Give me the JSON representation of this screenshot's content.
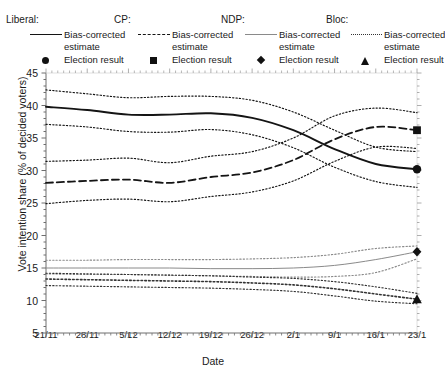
{
  "legend": {
    "groups": [
      {
        "title": "Liberal:",
        "line_label": "Bias-corrected\nestimate",
        "marker_label": "Election result",
        "line_style": "solid",
        "marker": "circle",
        "color": "#141414"
      },
      {
        "title": "CP:",
        "line_label": "Bias-corrected\nestimate",
        "marker_label": "Election result",
        "line_style": "dashed",
        "marker": "square",
        "color": "#141414"
      },
      {
        "title": "NDP:",
        "line_label": "Bias-corrected\nestimate",
        "marker_label": "Election result",
        "line_style": "thin-solid",
        "marker": "diamond",
        "color": "#8a8a8a"
      },
      {
        "title": "Bloc:",
        "line_label": "Bias-corrected\nestimate",
        "marker_label": "Election result",
        "line_style": "dotted",
        "marker": "triangle",
        "color": "#333333"
      }
    ]
  },
  "chart_data": {
    "type": "line",
    "title": "",
    "xlabel": "Date",
    "ylabel": "Vote intention share (% of decided voters)",
    "ylim": [
      5,
      45
    ],
    "yticks": [
      5,
      10,
      15,
      20,
      25,
      30,
      35,
      40,
      45
    ],
    "y_minor_step": 1,
    "grid": false,
    "legend_position": "top",
    "x": [
      "21/11",
      "28/11",
      "5/12",
      "12/12",
      "19/12",
      "26/12",
      "2/1",
      "9/1",
      "16/1",
      "23/1"
    ],
    "x_minor_per_major": 7,
    "series": [
      {
        "name": "Liberal",
        "style": "solid",
        "color": "#141414",
        "values": [
          39.8,
          39.3,
          38.6,
          38.6,
          38.8,
          38.1,
          36.2,
          33.3,
          31.0,
          30.2
        ],
        "band_upper": [
          42.4,
          41.8,
          41.2,
          41.4,
          41.4,
          40.8,
          39.0,
          36.2,
          33.6,
          32.9
        ],
        "band_lower": [
          37.1,
          36.7,
          36.0,
          35.9,
          36.3,
          35.5,
          33.5,
          30.5,
          28.3,
          27.4
        ],
        "election_result": 30.2,
        "election_marker": "circle"
      },
      {
        "name": "CP",
        "style": "dashed",
        "color": "#141414",
        "values": [
          28.1,
          28.4,
          28.6,
          28.1,
          29.0,
          29.7,
          31.6,
          34.8,
          36.7,
          36.2
        ],
        "band_upper": [
          31.4,
          31.6,
          31.9,
          31.2,
          32.2,
          32.9,
          35.0,
          38.4,
          39.6,
          38.9
        ],
        "band_lower": [
          24.9,
          25.4,
          25.6,
          25.2,
          26.0,
          26.7,
          28.4,
          31.4,
          33.6,
          33.4
        ],
        "election_result": 36.2,
        "election_marker": "square"
      },
      {
        "name": "NDP",
        "style": "thin-solid",
        "color": "#8a8a8a",
        "values": [
          15.0,
          15.0,
          15.0,
          15.0,
          14.9,
          14.9,
          15.0,
          15.4,
          16.3,
          17.5
        ],
        "band_upper": [
          16.2,
          16.2,
          16.3,
          16.3,
          16.3,
          16.4,
          16.6,
          17.1,
          18.0,
          18.4
        ],
        "band_lower": [
          14.1,
          14.0,
          14.0,
          13.9,
          13.8,
          13.7,
          13.6,
          13.7,
          14.3,
          16.4
        ],
        "election_result": 17.5,
        "election_marker": "diamond"
      },
      {
        "name": "Bloc",
        "style": "dotted",
        "color": "#333333",
        "values": [
          13.3,
          13.2,
          13.1,
          13.0,
          12.9,
          12.7,
          12.4,
          11.8,
          11.0,
          10.2
        ],
        "band_upper": [
          14.2,
          14.1,
          14.0,
          13.9,
          13.8,
          13.6,
          13.4,
          12.9,
          12.1,
          11.1
        ],
        "band_lower": [
          12.3,
          12.2,
          12.1,
          12.0,
          11.9,
          11.7,
          11.4,
          10.7,
          9.9,
          9.5
        ],
        "election_result": 10.2,
        "election_marker": "triangle"
      }
    ]
  }
}
